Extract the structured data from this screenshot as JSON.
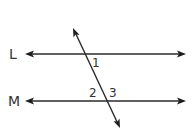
{
  "diagram": {
    "lines": [
      {
        "id": "L",
        "label": "L"
      },
      {
        "id": "M",
        "label": "M"
      }
    ],
    "transversal": {
      "label": ""
    },
    "angles": [
      {
        "id": "1",
        "label": "1"
      },
      {
        "id": "2",
        "label": "2"
      },
      {
        "id": "3",
        "label": "3"
      }
    ],
    "colors": {
      "stroke": "#2a2a2a",
      "text": "#333333",
      "background": "#ffffff"
    }
  }
}
